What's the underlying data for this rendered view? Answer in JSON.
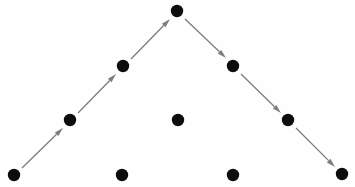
{
  "figure": {
    "title": "",
    "background_color": "#fefefe",
    "width": 355,
    "height": 187
  },
  "style": {
    "dot_color": "#0d0d0d",
    "dot_radius": 6.2,
    "arrow_color": "#7d7d7d",
    "arrow_width": 1.3,
    "arrowhead_length": 9,
    "arrowhead_width": 5
  },
  "chart_data": {
    "type": "scatter",
    "title": "",
    "xlabel": "",
    "ylabel": "",
    "xlim": [
      0,
      355
    ],
    "ylim": [
      0,
      187
    ],
    "grid": false,
    "legend": null,
    "annotations": [],
    "nodes": [
      {
        "id": "n1",
        "label": "",
        "x": 14,
        "y": 175,
        "row": "bottom",
        "on_path": true
      },
      {
        "id": "n2",
        "label": "",
        "x": 70,
        "y": 120,
        "row": "middle",
        "on_path": true
      },
      {
        "id": "n3",
        "label": "",
        "x": 123,
        "y": 66,
        "row": "upper",
        "on_path": true
      },
      {
        "id": "n4",
        "label": "",
        "x": 177,
        "y": 11,
        "row": "apex",
        "on_path": true
      },
      {
        "id": "n5",
        "label": "",
        "x": 233,
        "y": 66,
        "row": "upper",
        "on_path": true
      },
      {
        "id": "n6",
        "label": "",
        "x": 288,
        "y": 120,
        "row": "middle",
        "on_path": true
      },
      {
        "id": "n7",
        "label": "",
        "x": 342,
        "y": 174,
        "row": "bottom",
        "on_path": true
      },
      {
        "id": "n8",
        "label": "",
        "x": 122,
        "y": 175,
        "row": "bottom",
        "on_path": false
      },
      {
        "id": "n9",
        "label": "",
        "x": 178,
        "y": 120,
        "row": "middle",
        "on_path": false
      },
      {
        "id": "n10",
        "label": "",
        "x": 233,
        "y": 175,
        "row": "bottom",
        "on_path": false
      }
    ],
    "edges": [
      {
        "id": "e1",
        "from": "n1",
        "to": "n2",
        "direction": "up-right",
        "x1": 22,
        "y1": 168,
        "x2": 63,
        "y2": 128
      },
      {
        "id": "e2",
        "from": "n2",
        "to": "n3",
        "direction": "up-right",
        "x1": 78,
        "y1": 113,
        "x2": 116,
        "y2": 74
      },
      {
        "id": "e3",
        "from": "n3",
        "to": "n4",
        "direction": "up-right",
        "x1": 131,
        "y1": 59,
        "x2": 170,
        "y2": 19
      },
      {
        "id": "e4",
        "from": "n4",
        "to": "n5",
        "direction": "down-right",
        "x1": 185,
        "y1": 19,
        "x2": 226,
        "y2": 58
      },
      {
        "id": "e5",
        "from": "n5",
        "to": "n6",
        "direction": "down-right",
        "x1": 241,
        "y1": 74,
        "x2": 281,
        "y2": 113
      },
      {
        "id": "e6",
        "from": "n6",
        "to": "n7",
        "direction": "down-right",
        "x1": 296,
        "y1": 128,
        "x2": 335,
        "y2": 167
      }
    ]
  }
}
